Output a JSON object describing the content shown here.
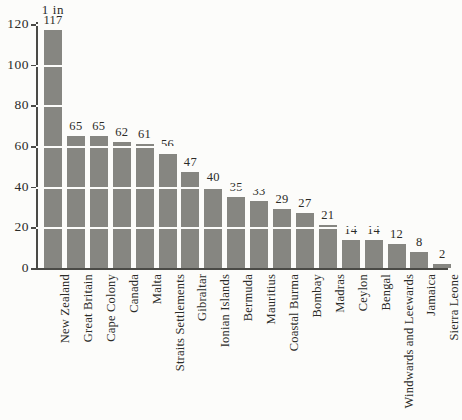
{
  "chart_data": {
    "type": "bar",
    "title": "1 in",
    "xlabel": "",
    "ylabel": "",
    "ylim": [
      0,
      120
    ],
    "yticks": [
      0,
      20,
      40,
      60,
      80,
      100,
      120
    ],
    "ytick_labels": [
      "0",
      "20",
      "40",
      "60",
      "80",
      "100",
      "120"
    ],
    "grid": true,
    "grid_orientation": "horizontal",
    "legend": false,
    "bar_color": "#868681",
    "background_color": "#fcfcfa",
    "axis_color": "#4a4a46",
    "value_labels": true,
    "categories": [
      "New Zealand",
      "Great Britain",
      "Cape Colony",
      "Canada",
      "Malta",
      "Straits Settlements",
      "Gibraltar",
      "Ionian Islands",
      "Bermuda",
      "Mauritius",
      "Coastal Burma",
      "Bombay",
      "Madras",
      "Ceylon",
      "Bengal",
      "Windwards and Leewards",
      "Jamaica",
      "Sierra Leone"
    ],
    "values": [
      117,
      65,
      65,
      62,
      61,
      56,
      47,
      40,
      35,
      33,
      29,
      27,
      21,
      14,
      14,
      12,
      8,
      2
    ]
  }
}
